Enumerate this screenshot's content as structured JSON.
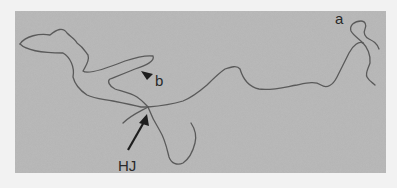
{
  "figure": {
    "type": "electron micrograph",
    "labels": {
      "a": "a",
      "b": "b",
      "hj": "HJ"
    },
    "colors": {
      "background": "#b4b4b4",
      "strand": "#555555",
      "label": "#2a2a2a"
    }
  }
}
